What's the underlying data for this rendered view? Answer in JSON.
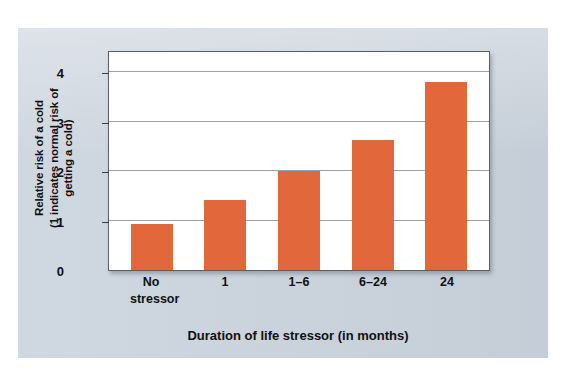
{
  "colors": {
    "bar": "#E2683C",
    "panel_background": "#C9D2DC",
    "plot_background": "#FFFFFF",
    "gridline": "#8C8F94",
    "text": "#101010"
  },
  "y_axis_title": {
    "line1": "Relative risk of a cold",
    "line2": "(1 indicates normal risk of",
    "line3": "getting a cold)"
  },
  "x_axis_title": "Duration of life stressor (in months)",
  "categories": [
    {
      "line1": "No",
      "line2": "stressor"
    },
    {
      "line1": "1",
      "line2": ""
    },
    {
      "line1": "1–6",
      "line2": ""
    },
    {
      "line1": "6–24",
      "line2": ""
    },
    {
      "line1": "24",
      "line2": ""
    }
  ],
  "y_ticks": [
    "0",
    "1",
    "2",
    "3",
    "4"
  ],
  "chart_data": {
    "type": "bar",
    "title": "",
    "subtitle": "",
    "xlabel": "Duration of life stressor (in months)",
    "ylabel": "Relative risk of a cold (1 indicates normal risk of getting a cold)",
    "categories": [
      "No stressor",
      "1",
      "1–6",
      "6–24",
      "24"
    ],
    "values": [
      0.93,
      1.42,
      2.0,
      2.62,
      3.8
    ],
    "ylim": [
      0,
      4.45
    ],
    "yticks": [
      0,
      1,
      2,
      3,
      4
    ],
    "grid": true,
    "legend": "none",
    "bar_color": "#E2683C"
  }
}
